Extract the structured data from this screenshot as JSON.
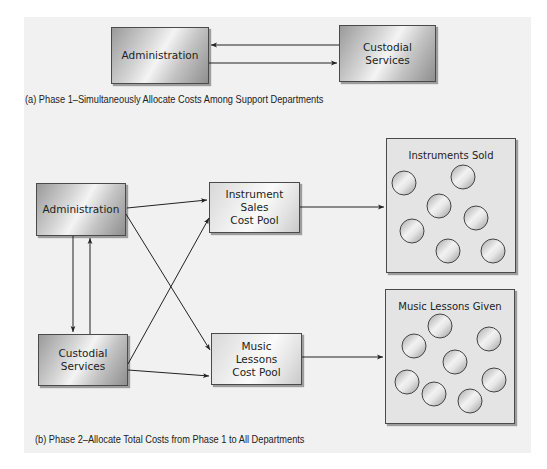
{
  "phase1": {
    "caption": "(a) Phase 1–Simultaneously Allocate Costs Among Support Departments",
    "nodes": {
      "administration": "Administration",
      "custodial": "Custodial Services"
    },
    "edges": [
      {
        "from": "Custodial Services",
        "to": "Administration"
      },
      {
        "from": "Administration",
        "to": "Custodial Services"
      }
    ]
  },
  "phase2": {
    "caption": "(b) Phase 2–Allocate Total Costs from Phase 1 to All Departments",
    "nodes": {
      "administration": "Administration",
      "custodial_line1": "Custodial",
      "custodial_line2": "Services",
      "instrument_pool_line1": "Instrument",
      "instrument_pool_line2": "Sales",
      "instrument_pool_line3": "Cost Pool",
      "lessons_pool_line1": "Music",
      "lessons_pool_line2": "Lessons",
      "lessons_pool_line3": "Cost Pool",
      "instruments_sold": "Instruments Sold",
      "lessons_given": "Music Lessons Given"
    },
    "instruments_sold_unit_count": 7,
    "lessons_given_unit_count": 8,
    "edges": [
      {
        "from": "Administration",
        "to": "Instrument Sales Cost Pool"
      },
      {
        "from": "Administration",
        "to": "Music Lessons Cost Pool"
      },
      {
        "from": "Administration",
        "to": "Custodial Services"
      },
      {
        "from": "Custodial Services",
        "to": "Administration"
      },
      {
        "from": "Custodial Services",
        "to": "Instrument Sales Cost Pool"
      },
      {
        "from": "Custodial Services",
        "to": "Music Lessons Cost Pool"
      },
      {
        "from": "Instrument Sales Cost Pool",
        "to": "Instruments Sold"
      },
      {
        "from": "Music Lessons Cost Pool",
        "to": "Music Lessons Given"
      }
    ]
  }
}
